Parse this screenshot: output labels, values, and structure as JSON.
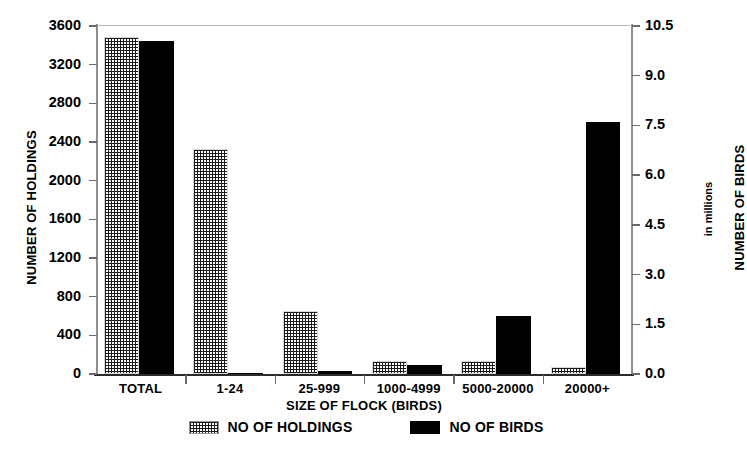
{
  "chart_data": {
    "type": "bar",
    "title": "",
    "xlabel": "SIZE OF FLOCK (BIRDS)",
    "ylabel": "NUMBER OF HOLDINGS",
    "y2label": "NUMBER OF BIRDS",
    "y2sublabel": "in millions",
    "categories": [
      "TOTAL",
      "1-24",
      "25-999",
      "1000-4999",
      "5000-20000",
      "20000+"
    ],
    "series": [
      {
        "name": "NO OF HOLDINGS",
        "axis": "left",
        "pattern": "crosshatch",
        "color": "#1a1a1a",
        "values": [
          3490,
          2330,
          655,
          130,
          135,
          75
        ]
      },
      {
        "name": "NO OF BIRDS",
        "axis": "right",
        "pattern": "solid",
        "color": "#000000",
        "values": [
          10.05,
          0.02,
          0.1,
          0.28,
          1.75,
          7.6
        ]
      }
    ],
    "ylim": [
      0,
      3600
    ],
    "yticks": [
      0,
      400,
      800,
      1200,
      1600,
      2000,
      2400,
      2800,
      3200,
      3600
    ],
    "yticklabels": [
      "0",
      "400",
      "800",
      "1200",
      "1600",
      "2000",
      "2400",
      "2800",
      "3200",
      "3600"
    ],
    "y2lim": [
      0,
      10.5
    ],
    "y2ticks": [
      0.0,
      1.5,
      3.0,
      4.5,
      6.0,
      7.5,
      9.0,
      10.5
    ],
    "y2ticklabels": [
      "0.0",
      "1.5",
      "3.0",
      "4.5",
      "6.0",
      "7.5",
      "9.0",
      "10.5"
    ],
    "grid": false,
    "legend_position": "bottom"
  },
  "legend": {
    "entries": [
      {
        "label": "NO OF HOLDINGS",
        "swatch": "crosshatch-swatch"
      },
      {
        "label": "NO OF BIRDS",
        "swatch": "solid-black-swatch"
      }
    ]
  }
}
